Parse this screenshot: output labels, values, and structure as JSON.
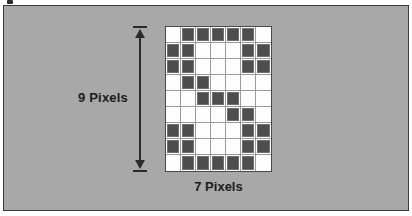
{
  "figure": {
    "background_color": "#a8a8a8",
    "frame_color": "#3a3a3a",
    "cell_on_color": "#4e4e4e",
    "cell_off_color": "#fdfdfd",
    "gridline_color": "#9a9a9a",
    "arrow_color": "#2b2b2b"
  },
  "labels": {
    "vertical": "9 Pixels",
    "horizontal": "7 Pixels"
  },
  "chart_data": {
    "type": "heatmap",
    "xlabel": "7 Pixels",
    "ylabel": "9 Pixels",
    "columns": 7,
    "rows": 9,
    "grid": [
      [
        0,
        1,
        1,
        1,
        1,
        1,
        0
      ],
      [
        1,
        1,
        0,
        0,
        0,
        1,
        1
      ],
      [
        1,
        1,
        0,
        0,
        0,
        1,
        1
      ],
      [
        0,
        1,
        1,
        0,
        0,
        0,
        0
      ],
      [
        0,
        0,
        1,
        1,
        1,
        0,
        0
      ],
      [
        0,
        0,
        0,
        0,
        1,
        1,
        0
      ],
      [
        1,
        1,
        0,
        0,
        0,
        1,
        1
      ],
      [
        1,
        1,
        0,
        0,
        0,
        1,
        1
      ],
      [
        0,
        1,
        1,
        1,
        1,
        1,
        0
      ]
    ],
    "legend": [
      {
        "value": 1,
        "name": "pixel on",
        "color": "#4e4e4e"
      },
      {
        "value": 0,
        "name": "pixel off",
        "color": "#fdfdfd"
      }
    ],
    "grid_on": true,
    "legend_position": "none"
  }
}
